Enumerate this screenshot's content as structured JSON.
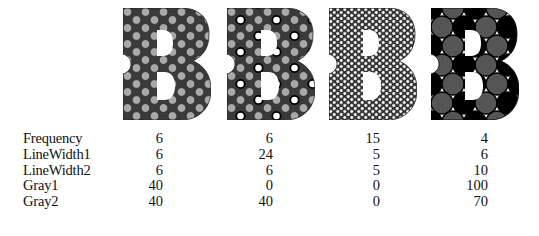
{
  "figures": [
    {
      "id": "b1",
      "letter": "B",
      "frequency": 6,
      "line_width_1": 6,
      "line_width_2": 6,
      "gray_1": 40,
      "gray_2": 40,
      "pattern": "uniform gray circles, thin dark outline"
    },
    {
      "id": "b2",
      "letter": "B",
      "frequency": 6,
      "line_width_1": 24,
      "line_width_2": 6,
      "gray_1": 0,
      "gray_2": 40,
      "pattern": "alternating white rings with thick outline and gray circles"
    },
    {
      "id": "b3",
      "letter": "B",
      "frequency": 15,
      "line_width_1": 5,
      "line_width_2": 5,
      "gray_1": 0,
      "gray_2": 0,
      "pattern": "fine white circles with thin outline"
    },
    {
      "id": "b4",
      "letter": "B",
      "frequency": 4,
      "line_width_1": 6,
      "line_width_2": 10,
      "gray_1": 100,
      "gray_2": 70,
      "pattern": "black and dark-gray circles with white triangular gaps"
    }
  ],
  "table": {
    "rows": [
      {
        "label": "Frequency",
        "values": [
          "6",
          "6",
          "15",
          "4"
        ]
      },
      {
        "label": "LineWidth1",
        "values": [
          "6",
          "24",
          "5",
          "6"
        ]
      },
      {
        "label": "LineWidth2",
        "values": [
          "6",
          "6",
          "5",
          "10"
        ]
      },
      {
        "label": "Gray1",
        "values": [
          "40",
          "0",
          "0",
          "100"
        ]
      },
      {
        "label": "Gray2",
        "values": [
          "40",
          "40",
          "0",
          "70"
        ]
      }
    ]
  },
  "colors": {
    "background": "#ffffff",
    "text": "#111111",
    "gray40": "#a8a8a8",
    "gray70": "#5a5a5a",
    "black": "#000000"
  }
}
